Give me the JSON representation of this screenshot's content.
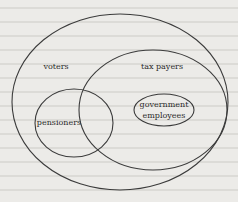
{
  "diagram": {
    "type": "venn/euler",
    "background_color": "#ecebe8",
    "stroke_color": "#3b3b3b",
    "sets": [
      {
        "id": "voters",
        "label": "voters"
      },
      {
        "id": "tax_payers",
        "label": "tax payers"
      },
      {
        "id": "pensioners",
        "label": "pensioners"
      },
      {
        "id": "government_employees",
        "label_line1": "government",
        "label_line2": "employees"
      }
    ],
    "relationships": [
      "tax payers overlaps voters (mostly contained within voters)",
      "pensioners is inside voters and overlaps tax payers",
      "government employees is inside tax payers"
    ]
  }
}
